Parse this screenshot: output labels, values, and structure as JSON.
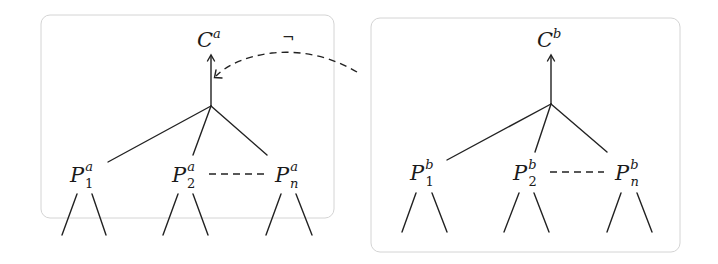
{
  "diagram": {
    "type": "tree-comparison",
    "panels": [
      {
        "id": "a",
        "root": {
          "base": "C",
          "sup": "a"
        },
        "children": [
          {
            "base": "P",
            "sub": "1",
            "sup": "a"
          },
          {
            "base": "P",
            "sub": "2",
            "sup": "a"
          },
          {
            "base": "P",
            "sub": "n",
            "sup": "a"
          }
        ],
        "ellipsis_between": [
          "P_2^a",
          "P_n^a"
        ]
      },
      {
        "id": "b",
        "root": {
          "base": "C",
          "sup": "b"
        },
        "children": [
          {
            "base": "P",
            "sub": "1",
            "sup": "b"
          },
          {
            "base": "P",
            "sub": "2",
            "sup": "b"
          },
          {
            "base": "P",
            "sub": "n",
            "sup": "b"
          }
        ],
        "ellipsis_between": [
          "P_2^b",
          "P_n^b"
        ]
      }
    ],
    "cross_edge": {
      "from": "panel-b",
      "to": "edge C^a",
      "style": "dashed-curved-arrow",
      "label": "¬"
    },
    "colors": {
      "ink": "#222222",
      "box_border": "#d4d4d4",
      "background": "#ffffff"
    }
  }
}
